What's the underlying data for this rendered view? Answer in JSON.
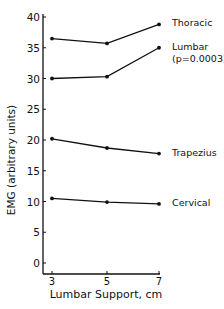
{
  "chart_data": {
    "type": "line",
    "title": "",
    "xlabel": "Lumbar Support, cm",
    "ylabel": "EMG (arbitrary units)",
    "x": [
      3,
      5,
      7
    ],
    "xticks": [
      "3",
      "5",
      "7"
    ],
    "yticks": [
      "0",
      "5",
      "10",
      "15",
      "20",
      "25",
      "30",
      "35",
      "40"
    ],
    "ylim": [
      -2,
      40
    ],
    "xlim": [
      3,
      7
    ],
    "grid": false,
    "legend_position": "inline-right",
    "series": [
      {
        "name": "Thoracic",
        "label": "Thoracic",
        "values": [
          36.5,
          35.7,
          38.8
        ]
      },
      {
        "name": "Lumbar",
        "label": "Lumbar",
        "annotation": "(p=0.0003)",
        "values": [
          30.0,
          30.3,
          35.0
        ]
      },
      {
        "name": "Trapezius",
        "label": "Trapezius",
        "values": [
          20.2,
          18.7,
          17.8
        ]
      },
      {
        "name": "Cervical",
        "label": "Cervical",
        "values": [
          10.5,
          9.9,
          9.6
        ]
      }
    ],
    "colors": {
      "line": "#111111",
      "background": "#ffffff"
    }
  }
}
